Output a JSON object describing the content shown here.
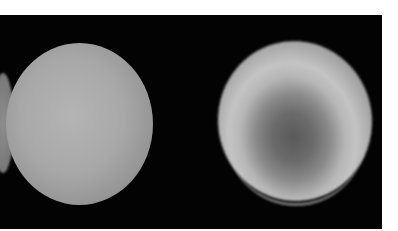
{
  "image": {
    "description": "Two grayscale images of a planet-like sphere on a black background",
    "panels": [
      {
        "label": "left",
        "description": "Uniformly lit gray sphere"
      },
      {
        "label": "right",
        "description": "Sphere with bright ring band and darker center region"
      }
    ],
    "colors": {
      "background": "#030303",
      "page": "#ffffff",
      "left_sphere": "#a8a8a8",
      "right_sphere_ring": "#c4c4c4",
      "right_sphere_center": "#5a5a5a"
    }
  }
}
